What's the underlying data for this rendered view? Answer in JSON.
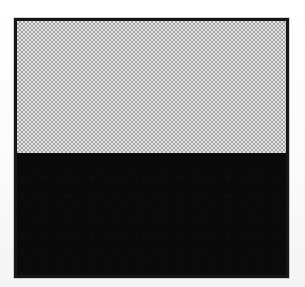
{
  "figure": {
    "title": "Two-tone bordered panel",
    "caption": "",
    "background_color": "#ffffff",
    "border_color": "#161616",
    "border_width_px": 3,
    "panel": {
      "x_px": 14,
      "y_px": 18,
      "width_px": 275,
      "height_px": 260
    },
    "bands": [
      {
        "name": "upper-band",
        "fill_style": "checkerboard-dither",
        "tone_label": "50% gray halftone",
        "color_light": "#e8e8e8",
        "color_dark": "#8e8e8e",
        "cell_size_px": 2,
        "height_percent": 52
      },
      {
        "name": "lower-band",
        "fill_style": "solid",
        "tone_label": "solid black",
        "color_light": "#0a0a0a",
        "color_dark": "#000000",
        "cell_size_px": 0,
        "height_percent": 48
      }
    ],
    "divider": {
      "name": "tone-boundary",
      "color": "#101010",
      "y_percent": 52
    }
  }
}
